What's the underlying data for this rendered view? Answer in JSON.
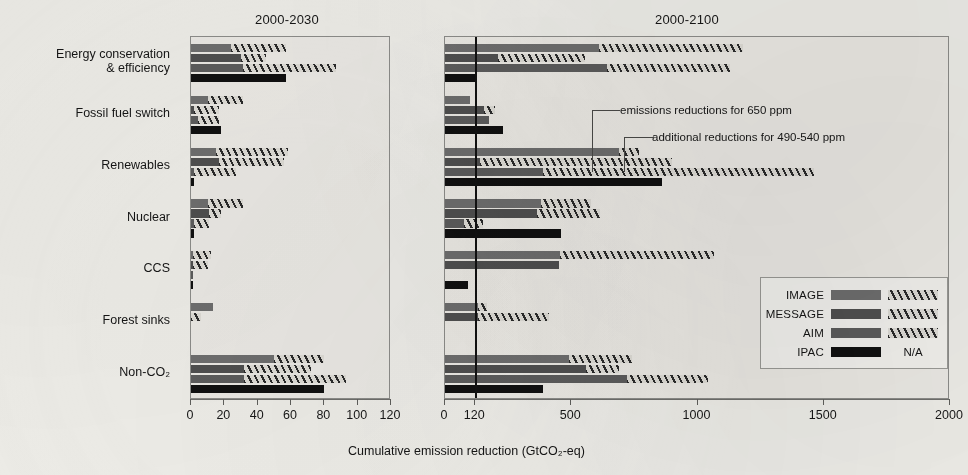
{
  "figure": {
    "xlabel": "Cumulative emission reduction (GtCO₂-eq)",
    "panels": [
      {
        "title": "2000-2030"
      },
      {
        "title": "2000-2100"
      }
    ],
    "annotations": [
      {
        "text": "emissions reductions for 650 ppm"
      },
      {
        "text": "additional reductions for 490-540 ppm"
      }
    ]
  },
  "legend": {
    "entries": [
      {
        "label": "IMAGE",
        "solid": "#6e6e6e",
        "additional": "hatch"
      },
      {
        "label": "MESSAGE",
        "solid": "#4f4f4f",
        "additional": "hatch"
      },
      {
        "label": "AIM",
        "solid": "#5c5c5c",
        "additional": "hatch"
      },
      {
        "label": "IPAC",
        "solid": "#101010",
        "additional": "N/A"
      }
    ],
    "na_text": "N/A"
  },
  "categories": [
    "Energy conservation\n& efficiency",
    "Fossil fuel switch",
    "Renewables",
    "Nuclear",
    "CCS",
    "Forest sinks",
    "Non-CO₂"
  ],
  "chart_data": {
    "type": "bar",
    "orientation": "horizontal",
    "xlabel": "Cumulative emission reduction (GtCO2-eq)",
    "ylabel": "",
    "grid": false,
    "legend_position": "bottom-right",
    "series_names": [
      "IMAGE",
      "MESSAGE",
      "AIM",
      "IPAC"
    ],
    "stack_parts": [
      "emissions reductions for 650 ppm",
      "additional reductions for 490-540 ppm"
    ],
    "panels": [
      {
        "title": "2000-2030",
        "xlim": [
          0,
          120
        ],
        "xticks": [
          0,
          20,
          40,
          60,
          80,
          100,
          120
        ],
        "xtick_labels": [
          "0",
          "20",
          "40",
          "60",
          "80",
          "100",
          "120"
        ],
        "reference_line": null,
        "categories": [
          "Energy conservation & efficiency",
          "Fossil fuel switch",
          "Renewables",
          "Nuclear",
          "CCS",
          "Forest sinks",
          "Non-CO2"
        ],
        "data": [
          {
            "category": "Energy conservation & efficiency",
            "bars": [
              {
                "model": "IMAGE",
                "base": 24,
                "additional": 33
              },
              {
                "model": "MESSAGE",
                "base": 30,
                "additional": 15
              },
              {
                "model": "AIM",
                "base": 31,
                "additional": 56
              },
              {
                "model": "IPAC",
                "base": 57,
                "additional": null
              }
            ]
          },
          {
            "category": "Fossil fuel switch",
            "bars": [
              {
                "model": "IMAGE",
                "base": 10,
                "additional": 21
              },
              {
                "model": "MESSAGE",
                "base": 2,
                "additional": 15
              },
              {
                "model": "AIM",
                "base": 4,
                "additional": 13
              },
              {
                "model": "IPAC",
                "base": 18,
                "additional": null
              }
            ]
          },
          {
            "category": "Renewables",
            "bars": [
              {
                "model": "IMAGE",
                "base": 15,
                "additional": 43
              },
              {
                "model": "MESSAGE",
                "base": 17,
                "additional": 39
              },
              {
                "model": "AIM",
                "base": 2,
                "additional": 25
              },
              {
                "model": "IPAC",
                "base": 2,
                "additional": null
              }
            ]
          },
          {
            "category": "Nuclear",
            "bars": [
              {
                "model": "IMAGE",
                "base": 10,
                "additional": 21
              },
              {
                "model": "MESSAGE",
                "base": 11,
                "additional": 7
              },
              {
                "model": "AIM",
                "base": 2,
                "additional": 9
              },
              {
                "model": "IPAC",
                "base": 2,
                "additional": null
              }
            ]
          },
          {
            "category": "CCS",
            "bars": [
              {
                "model": "IMAGE",
                "base": 1,
                "additional": 11
              },
              {
                "model": "MESSAGE",
                "base": 1,
                "additional": 9
              },
              {
                "model": "AIM",
                "base": 1,
                "additional": 0
              },
              {
                "model": "IPAC",
                "base": 1,
                "additional": null
              }
            ]
          },
          {
            "category": "Forest sinks",
            "bars": [
              {
                "model": "IMAGE",
                "base": 13,
                "additional": 0
              },
              {
                "model": "MESSAGE",
                "base": 0,
                "additional": 6
              },
              {
                "model": "AIM",
                "base": 0,
                "additional": 0
              },
              {
                "model": "IPAC",
                "base": 0,
                "additional": null
              }
            ]
          },
          {
            "category": "Non-CO2",
            "bars": [
              {
                "model": "IMAGE",
                "base": 50,
                "additional": 30
              },
              {
                "model": "MESSAGE",
                "base": 32,
                "additional": 40
              },
              {
                "model": "AIM",
                "base": 32,
                "additional": 61
              },
              {
                "model": "IPAC",
                "base": 80,
                "additional": null
              }
            ]
          }
        ]
      },
      {
        "title": "2000-2100",
        "xlim": [
          0,
          2000
        ],
        "xticks": [
          0,
          120,
          500,
          1000,
          1500,
          2000
        ],
        "xtick_labels": [
          "0",
          "120",
          "500",
          "1000",
          "1500",
          "2000"
        ],
        "reference_line": 120,
        "categories": [
          "Energy conservation & efficiency",
          "Fossil fuel switch",
          "Renewables",
          "Nuclear",
          "CCS",
          "Forest sinks",
          "Non-CO2"
        ],
        "data": [
          {
            "category": "Energy conservation & efficiency",
            "bars": [
              {
                "model": "IMAGE",
                "base": 610,
                "additional": 570
              },
              {
                "model": "MESSAGE",
                "base": 210,
                "additional": 345
              },
              {
                "model": "AIM",
                "base": 640,
                "additional": 490
              },
              {
                "model": "IPAC",
                "base": 125,
                "additional": null
              }
            ]
          },
          {
            "category": "Fossil fuel switch",
            "bars": [
              {
                "model": "IMAGE",
                "base": 100,
                "additional": 0
              },
              {
                "model": "MESSAGE",
                "base": 155,
                "additional": 45
              },
              {
                "model": "AIM",
                "base": 175,
                "additional": 0
              },
              {
                "model": "IPAC",
                "base": 230,
                "additional": null
              }
            ]
          },
          {
            "category": "Renewables",
            "bars": [
              {
                "model": "IMAGE",
                "base": 690,
                "additional": 80
              },
              {
                "model": "MESSAGE",
                "base": 140,
                "additional": 760
              },
              {
                "model": "AIM",
                "base": 390,
                "additional": 1070
              },
              {
                "model": "IPAC",
                "base": 860,
                "additional": null
              }
            ]
          },
          {
            "category": "Nuclear",
            "bars": [
              {
                "model": "IMAGE",
                "base": 380,
                "additional": 200
              },
              {
                "model": "MESSAGE",
                "base": 365,
                "additional": 250
              },
              {
                "model": "AIM",
                "base": 75,
                "additional": 75
              },
              {
                "model": "IPAC",
                "base": 460,
                "additional": null
              }
            ]
          },
          {
            "category": "CCS",
            "bars": [
              {
                "model": "IMAGE",
                "base": 455,
                "additional": 610
              },
              {
                "model": "MESSAGE",
                "base": 450,
                "additional": 0
              },
              {
                "model": "AIM",
                "base": 0,
                "additional": 0
              },
              {
                "model": "IPAC",
                "base": 90,
                "additional": null
              }
            ]
          },
          {
            "category": "Forest sinks",
            "bars": [
              {
                "model": "IMAGE",
                "base": 130,
                "additional": 35
              },
              {
                "model": "MESSAGE",
                "base": 130,
                "additional": 280
              },
              {
                "model": "AIM",
                "base": 0,
                "additional": 0
              },
              {
                "model": "IPAC",
                "base": 0,
                "additional": null
              }
            ]
          },
          {
            "category": "Non-CO2",
            "bars": [
              {
                "model": "IMAGE",
                "base": 490,
                "additional": 250
              },
              {
                "model": "MESSAGE",
                "base": 560,
                "additional": 130
              },
              {
                "model": "AIM",
                "base": 720,
                "additional": 320
              },
              {
                "model": "IPAC",
                "base": 390,
                "additional": null
              }
            ]
          }
        ]
      }
    ]
  },
  "layout": {
    "left_panel": {
      "x": 190,
      "y": 36,
      "w": 200,
      "h": 363
    },
    "right_panel": {
      "x": 444,
      "y": 36,
      "w": 505,
      "h": 363
    },
    "label_col_right": 180
  }
}
